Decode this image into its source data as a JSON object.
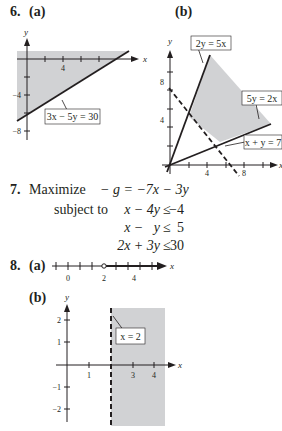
{
  "problem6": {
    "number": "6.",
    "part_a": "(a)",
    "part_b": "(b)",
    "graph_a": {
      "x_axis_label": "x",
      "y_axis_label": "y",
      "x_tick_label": "4",
      "y_tick_labels": [
        "−4",
        "−8"
      ],
      "boundary_label": "3x − 5y = 30",
      "shade_color": "#d1d2d4"
    },
    "graph_b": {
      "x_axis_label": "x",
      "y_axis_label": "y",
      "x_tick_labels": [
        "4",
        "8"
      ],
      "y_tick_labels": [
        "4",
        "8"
      ],
      "line_labels": [
        "2y = 5x",
        "5y = 2x",
        "x + y = 7"
      ],
      "shade_color": "#d1d2d4"
    }
  },
  "problem7": {
    "number": "7.",
    "objective_prefix": "Maximize",
    "objective": "− g = −7x − 3y",
    "subject_to": "subject to",
    "constraints": [
      {
        "lhs": "x − 4y",
        "rel": "≤",
        "rhs": "−4"
      },
      {
        "lhs": "x −   y",
        "rel": "≤",
        "rhs": "5"
      },
      {
        "lhs": "2x + 3y",
        "rel": "≤",
        "rhs": "30"
      }
    ]
  },
  "problem8": {
    "number": "8.",
    "part_a": "(a)",
    "part_b": "(b)",
    "number_line": {
      "axis_label": "x",
      "tick_labels": [
        "0",
        "2",
        "4"
      ],
      "open_point": "2"
    },
    "graph_b": {
      "x_axis_label": "x",
      "y_axis_label": "y",
      "x_tick_labels": [
        "1",
        "3",
        "4"
      ],
      "y_tick_labels": [
        "2",
        "1",
        "−1",
        "−2"
      ],
      "boundary_label": "x = 2",
      "shade_color": "#d1d2d4"
    }
  }
}
